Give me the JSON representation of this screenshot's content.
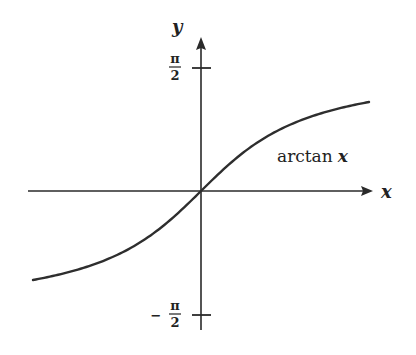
{
  "figure": {
    "function_label": "arctan",
    "function_var": "x",
    "x_axis_label": "x",
    "y_axis_label": "y",
    "ticks": {
      "top": {
        "sign": "",
        "numerator": "π",
        "denominator": "2"
      },
      "bottom": {
        "sign": "−",
        "numerator": "π",
        "denominator": "2"
      }
    }
  },
  "chart_data": {
    "type": "line",
    "title": "",
    "function": "arctan x",
    "xlabel": "x",
    "ylabel": "y",
    "xlim": [
      -2.1,
      2.1
    ],
    "ylim": [
      -1.5708,
      1.5708
    ],
    "yticks": [
      {
        "value": 1.5708,
        "label": "π/2"
      },
      {
        "value": -1.5708,
        "label": "−π/2"
      }
    ],
    "asymptotes": [
      1.5708,
      -1.5708
    ],
    "grid": false,
    "legend": "none",
    "annotations": [
      {
        "text": "arctan x",
        "x": 1.0,
        "y": 0.55
      }
    ],
    "series": [
      {
        "name": "arctan x",
        "x": [
          -2.1,
          -1.5,
          -1.0,
          -0.5,
          0,
          0.5,
          1.0,
          1.5,
          2.1
        ],
        "y": [
          -1.1263,
          -0.9828,
          -0.7854,
          -0.4636,
          0,
          0.4636,
          0.7854,
          0.9828,
          1.1263
        ]
      }
    ]
  }
}
